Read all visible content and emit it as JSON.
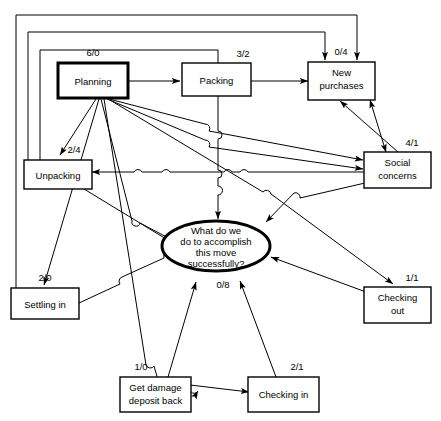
{
  "diagram": {
    "type": "cognitive-map",
    "goal": {
      "id": "goal",
      "lines": [
        "What do we",
        "do to accomplish",
        "this move",
        "successfully?"
      ],
      "ratio": "0/8",
      "shape": "ellipse",
      "emphasis": "thick"
    },
    "nodes": [
      {
        "id": "planning",
        "lines": [
          "Planning"
        ],
        "ratio": "6/0",
        "emphasis": "thick"
      },
      {
        "id": "packing",
        "lines": [
          "Packing"
        ],
        "ratio": "3/2",
        "emphasis": "normal"
      },
      {
        "id": "new-purchases",
        "lines": [
          "New",
          "purchases"
        ],
        "ratio": "0/4",
        "emphasis": "normal"
      },
      {
        "id": "social-concerns",
        "lines": [
          "Social",
          "concerns"
        ],
        "ratio": "4/1",
        "emphasis": "normal"
      },
      {
        "id": "unpacking",
        "lines": [
          "Unpacking"
        ],
        "ratio": "2/4",
        "emphasis": "normal"
      },
      {
        "id": "settling-in",
        "lines": [
          "Settling in"
        ],
        "ratio": "2/0",
        "emphasis": "normal"
      },
      {
        "id": "checking-out",
        "lines": [
          "Checking",
          "out"
        ],
        "ratio": "1/1",
        "emphasis": "normal"
      },
      {
        "id": "get-damage-deposit-back",
        "lines": [
          "Get damage",
          "deposit back"
        ],
        "ratio": "1/0",
        "emphasis": "normal"
      },
      {
        "id": "checking-in",
        "lines": [
          "Checking in"
        ],
        "ratio": "2/1",
        "emphasis": "normal"
      }
    ],
    "edges": [
      {
        "from": "planning",
        "to": "packing",
        "arrow": "single"
      },
      {
        "from": "packing",
        "to": "new-purchases",
        "arrow": "single"
      },
      {
        "from": "planning",
        "to": "new-purchases",
        "arrow": "single"
      },
      {
        "from": "planning",
        "to": "unpacking",
        "arrow": "single"
      },
      {
        "from": "planning",
        "to": "settling-in",
        "arrow": "single"
      },
      {
        "from": "planning",
        "to": "social-concerns",
        "arrow": "single"
      },
      {
        "from": "planning",
        "to": "checking-out",
        "arrow": "single"
      },
      {
        "from": "planning",
        "to": "checking-in",
        "arrow": "single"
      },
      {
        "from": "planning",
        "to": "goal",
        "arrow": "single"
      },
      {
        "from": "packing",
        "to": "goal",
        "arrow": "single"
      },
      {
        "from": "social-concerns",
        "to": "new-purchases",
        "arrow": "double"
      },
      {
        "from": "social-concerns",
        "to": "unpacking",
        "arrow": "single"
      },
      {
        "from": "social-concerns",
        "to": "goal",
        "arrow": "single"
      },
      {
        "from": "unpacking",
        "to": "goal",
        "arrow": "single"
      },
      {
        "from": "settling-in",
        "to": "goal",
        "arrow": "single"
      },
      {
        "from": "checking-out",
        "to": "goal",
        "arrow": "single"
      },
      {
        "from": "checking-in",
        "to": "goal",
        "arrow": "single"
      },
      {
        "from": "get-damage-deposit-back",
        "to": "checking-in",
        "arrow": "single"
      },
      {
        "from": "get-damage-deposit-back",
        "to": "goal",
        "arrow": "single"
      }
    ]
  }
}
